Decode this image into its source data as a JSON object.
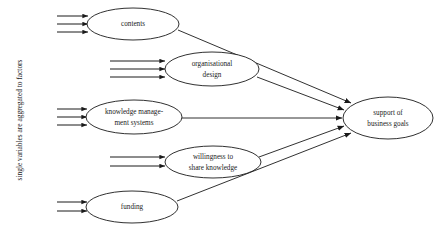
{
  "diagram": {
    "title": "single variables are aggregated to factors",
    "side_label": {
      "text": "single variables are aggregated to factors",
      "orientation": "vertical-rotated-90ccw",
      "x": 22,
      "y": 120
    },
    "colors": {
      "stroke": "#1a1a1a",
      "fill": "#ffffff",
      "background": "#ffffff"
    },
    "nodes": [
      {
        "id": "contents",
        "lines": [
          "contents"
        ],
        "cx": 133,
        "cy": 24,
        "rx": 46,
        "ry": 16,
        "feeder_count": 3,
        "feeder_x_start": 57,
        "feeder_x_end": 88,
        "feeder_spacing": 8
      },
      {
        "id": "organisational-design",
        "lines": [
          "organisational",
          "design"
        ],
        "cx": 212,
        "cy": 69,
        "rx": 47,
        "ry": 17,
        "feeder_count": 3,
        "feeder_x_start": 110,
        "feeder_x_end": 165,
        "feeder_spacing": 8
      },
      {
        "id": "knowledge-management-systems",
        "lines": [
          "knowledge manage-",
          "ment systems"
        ],
        "cx": 134,
        "cy": 117,
        "rx": 48,
        "ry": 17,
        "feeder_count": 3,
        "feeder_x_start": 57,
        "feeder_x_end": 87,
        "feeder_spacing": 8
      },
      {
        "id": "willingness-to-share-knowledge",
        "lines": [
          "willingness to",
          "share knowledge"
        ],
        "cx": 213,
        "cy": 162,
        "rx": 48,
        "ry": 16,
        "feeder_count": 2,
        "feeder_x_start": 110,
        "feeder_x_end": 165,
        "feeder_spacing": 9
      },
      {
        "id": "funding",
        "lines": [
          "funding"
        ],
        "cx": 132,
        "cy": 207,
        "rx": 46,
        "ry": 16,
        "feeder_count": 2,
        "feeder_x_start": 57,
        "feeder_x_end": 87,
        "feeder_spacing": 9
      },
      {
        "id": "support-of-business-goals",
        "lines": [
          "support of",
          "business goals"
        ],
        "cx": 388,
        "cy": 118,
        "rx": 45,
        "ry": 21,
        "feeder_count": 0
      }
    ],
    "edges": [
      {
        "id": "contents-to-support",
        "from": "contents",
        "to": "support-of-business-goals",
        "x1": 178,
        "y1": 30,
        "x2": 351,
        "y2": 103
      },
      {
        "id": "organisational-design-to-support",
        "from": "organisational-design",
        "to": "support-of-business-goals",
        "x1": 257,
        "y1": 77,
        "x2": 344,
        "y2": 110
      },
      {
        "id": "knowledge-management-systems-to-support",
        "from": "knowledge-management-systems",
        "to": "support-of-business-goals",
        "x1": 182,
        "y1": 118,
        "x2": 342,
        "y2": 118
      },
      {
        "id": "willingness-to-support",
        "from": "willingness-to-share-knowledge",
        "to": "support-of-business-goals",
        "x1": 259,
        "y1": 157,
        "x2": 344,
        "y2": 126
      },
      {
        "id": "funding-to-support",
        "from": "funding",
        "to": "support-of-business-goals",
        "x1": 177,
        "y1": 201,
        "x2": 351,
        "y2": 133
      }
    ]
  }
}
